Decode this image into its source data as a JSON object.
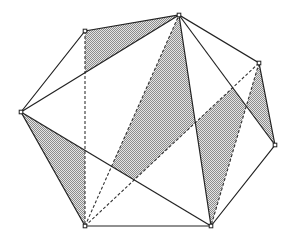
{
  "diagram": {
    "type": "heptagon-triangulation",
    "shade_color": "#9a9a9a",
    "line_color": "#222222",
    "vertices": [
      {
        "id": "A",
        "x": 21,
        "y": 112
      },
      {
        "id": "B",
        "x": 85,
        "y": 31
      },
      {
        "id": "C",
        "x": 179,
        "y": 15
      },
      {
        "id": "D",
        "x": 259,
        "y": 63
      },
      {
        "id": "E",
        "x": 275,
        "y": 145
      },
      {
        "id": "F",
        "x": 211,
        "y": 226
      },
      {
        "id": "G",
        "x": 85,
        "y": 226
      }
    ],
    "solid_diagonals": [
      [
        "A",
        "C"
      ],
      [
        "A",
        "F"
      ],
      [
        "C",
        "F"
      ],
      [
        "C",
        "E"
      ]
    ],
    "dashed_lines": [
      [
        "B",
        "G"
      ],
      [
        "G",
        "C"
      ],
      [
        "G",
        "D"
      ],
      [
        "D",
        "F"
      ]
    ],
    "shaded_regions": [
      [
        [
          85,
          31
        ],
        [
          179,
          15
        ],
        [
          85,
          72.7
        ]
      ],
      [
        [
          21,
          112
        ],
        [
          85,
          150.4
        ],
        [
          85,
          226
        ]
      ],
      [
        [
          111.6,
          166.3
        ],
        [
          179,
          15
        ],
        [
          195.3,
          122.7
        ],
        [
          134.2,
          179.9
        ]
      ],
      [
        [
          195.3,
          122.7
        ],
        [
          232.7,
          87.7
        ],
        [
          246.3,
          106.1
        ],
        [
          211,
          226
        ]
      ],
      [
        [
          259,
          63
        ],
        [
          275,
          145
        ],
        [
          246.3,
          106.1
        ]
      ]
    ]
  }
}
